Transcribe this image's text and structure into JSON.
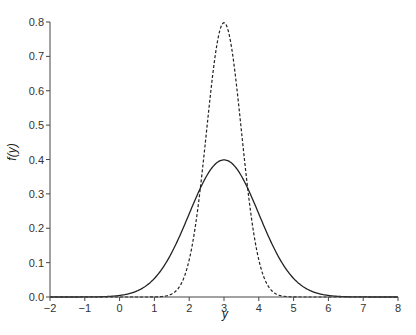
{
  "chart_data": {
    "type": "line",
    "title": "",
    "xlabel": "y",
    "ylabel": "f(y)",
    "xlim": [
      -2,
      8
    ],
    "ylim": [
      0,
      0.8
    ],
    "grid": false,
    "legend": null,
    "xticks": [
      -2,
      -1,
      0,
      1,
      2,
      3,
      4,
      5,
      6,
      7,
      8
    ],
    "xtick_labels": [
      "−2",
      "−1",
      "0",
      "1",
      "2",
      "3",
      "4",
      "5",
      "6",
      "7",
      "8"
    ],
    "yticks": [
      0.0,
      0.1,
      0.2,
      0.3,
      0.4,
      0.5,
      0.6,
      0.7,
      0.8
    ],
    "ytick_labels": [
      "0.0",
      "0.1",
      "0.2",
      "0.3",
      "0.4",
      "0.5",
      "0.6",
      "0.7",
      "0.8"
    ],
    "series": [
      {
        "name": "Normal(mean=3, sd=1)",
        "style": "solid",
        "color": "#222222",
        "mean": 3,
        "sd": 1,
        "peak": 0.4,
        "x": [
          -2,
          -1,
          0,
          0.5,
          1,
          1.5,
          2,
          2.5,
          3,
          3.5,
          4,
          4.5,
          5,
          5.5,
          6,
          7,
          8
        ],
        "values": [
          0.0,
          0.0001,
          0.0044,
          0.0175,
          0.054,
          0.1295,
          0.242,
          0.352,
          0.399,
          0.352,
          0.242,
          0.1295,
          0.054,
          0.0175,
          0.0044,
          0.0001,
          0.0
        ]
      },
      {
        "name": "Normal(mean=3, sd=0.5)",
        "style": "dashed",
        "color": "#222222",
        "mean": 3,
        "sd": 0.5,
        "peak": 0.8,
        "x": [
          -2,
          1,
          1.5,
          2,
          2.25,
          2.5,
          2.75,
          3,
          3.25,
          3.5,
          3.75,
          4,
          4.5,
          5,
          8
        ],
        "values": [
          0.0,
          0.0003,
          0.0089,
          0.108,
          0.259,
          0.484,
          0.704,
          0.798,
          0.704,
          0.484,
          0.259,
          0.108,
          0.0089,
          0.0003,
          0.0
        ]
      }
    ]
  }
}
